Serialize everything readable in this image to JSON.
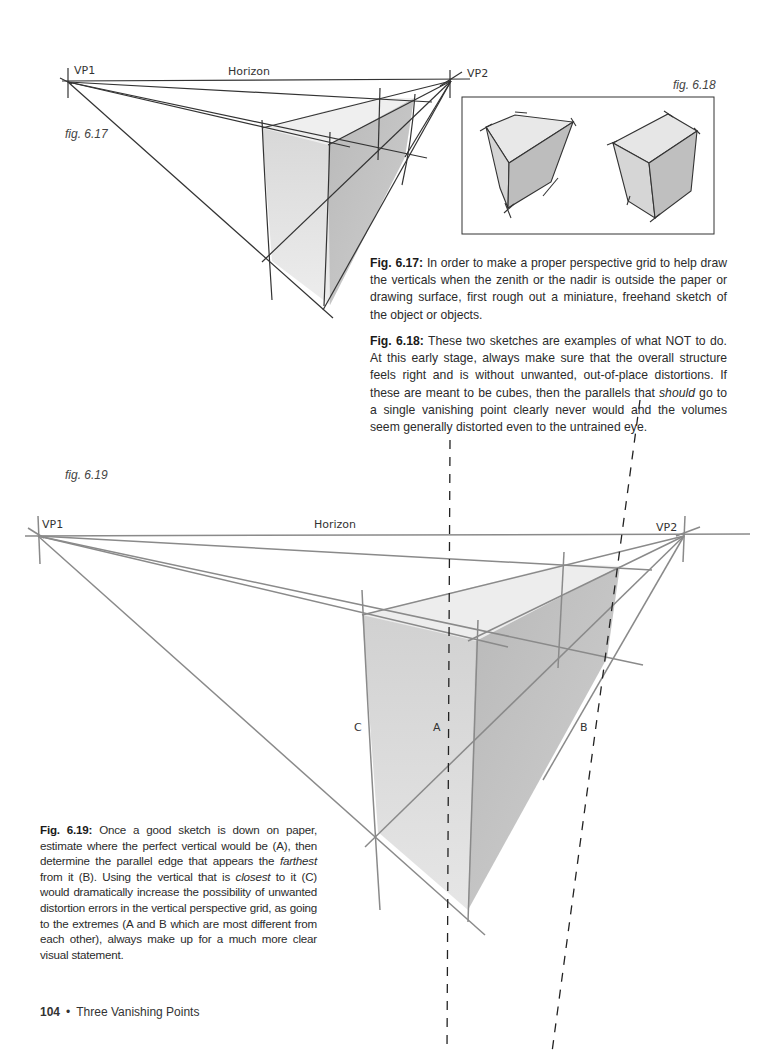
{
  "fig_6_17": {
    "label": "fig. 6.17",
    "vp1": "VP1",
    "vp2": "VP2",
    "horizon": "Horizon"
  },
  "fig_6_18": {
    "label": "fig. 6.18"
  },
  "caption_6_17": {
    "title": "Fig. 6.17:",
    "text": " In order to make a proper perspective grid to help draw the verticals when the zenith or the nadir is outside the paper or drawing surface, first rough out a miniature, freehand sketch of the object or objects."
  },
  "caption_6_18": {
    "title": "Fig. 6.18:",
    "text_1": " These two sketches are examples of what NOT to do. At this early stage, always make sure that the overall structure feels right and is without unwanted, out-of-place distortions. If these are meant to be cubes, then the parallels that ",
    "emphasis": "should",
    "text_2": " go to a single vanishing point clearly never would and the volumes seem generally distorted even to the untrained eye."
  },
  "fig_6_19": {
    "label": "fig. 6.19",
    "vp1": "VP1",
    "vp2": "VP2",
    "horizon": "Horizon",
    "marker_a": "A",
    "marker_b": "B",
    "marker_c": "C"
  },
  "caption_6_19": {
    "title": "Fig. 6.19:",
    "text_1": " Once a good sketch is down on paper, estimate where the perfect vertical would be (A), then determine the parallel edge that appears the ",
    "emphasis_1": "farthest",
    "text_2": " from it (B). Using the vertical that is ",
    "emphasis_2": "closest",
    "text_3": " to it (C) would dramatically increase the possibility of unwanted distortion errors in the vertical perspective grid, as going to the extremes (A and B which are most different from each other), always make up for a much more clear visual statement."
  },
  "footer": {
    "page_number": "104",
    "separator": "•",
    "chapter": "Three Vanishing Points"
  }
}
